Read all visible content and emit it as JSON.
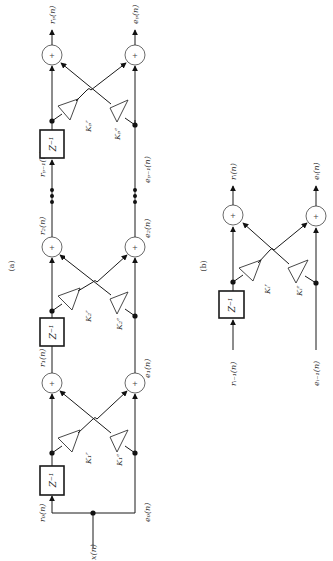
{
  "figure": {
    "panel_a": {
      "caption": "(a)",
      "input": "x(n)",
      "stage_labels_top": [
        "r_0(n)",
        "r_1(n)",
        "r_2(n)",
        "r_{p-1}(n)",
        "r_p(n)"
      ],
      "stage_labels_bottom": [
        "e_0(n)",
        "e_1(n)",
        "e_2(n)",
        "e_{p-1}(n)",
        "e_p(n)"
      ],
      "labels": {
        "r0": "r₀(n)",
        "r1": "r₁(n)",
        "r2": "r₂(n)",
        "rp1": "rₚ₋₁(n)",
        "rp": "rₚ(n)",
        "e0": "e₀(n)",
        "e1": "e₁(n)",
        "e2": "e₂(n)",
        "ep1": "eₚ₋₁(n)",
        "ep": "eₚ(n)",
        "x": "x(n)"
      },
      "gains": {
        "k1r": "K₁ʳ",
        "k1e": "K₁ᵉ",
        "k2r": "K₂ʳ",
        "k2e": "K₂ᵉ",
        "kpr": "Kₚʳ",
        "kpe": "Kₚᵉ"
      },
      "delay": "Z⁻¹",
      "adder": "+"
    },
    "panel_b": {
      "caption": "(b)",
      "labels": {
        "ri1": "rᵢ₋₁(n)",
        "ei1": "eᵢ₋₁(n)",
        "ri": "rᵢ(n)",
        "ei": "eᵢ(n)"
      },
      "gains": {
        "kir": "Kᵢʳ",
        "kie": "Kᵢᵉ"
      },
      "delay": "Z⁻¹",
      "adder": "+"
    }
  }
}
